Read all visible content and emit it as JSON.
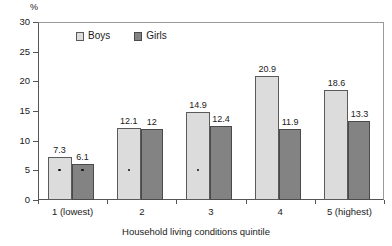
{
  "chart_data": {
    "type": "bar",
    "title": "",
    "xlabel": "Household living conditions quintile",
    "ylabel": "%",
    "ylim": [
      0,
      30
    ],
    "yticks": [
      0,
      5,
      10,
      15,
      20,
      25,
      30
    ],
    "grid": false,
    "legend_position": "top-center",
    "categories": [
      "1 (lowest)",
      "2",
      "3",
      "4",
      "5 (highest)"
    ],
    "series": [
      {
        "name": "Boys",
        "values": [
          7.3,
          12.1,
          14.9,
          20.9,
          18.6
        ],
        "labels": [
          "7.3",
          "12.1",
          "14.9",
          "20.9",
          "18.6"
        ],
        "color": "#dcdcdc"
      },
      {
        "name": "Girls",
        "values": [
          6.1,
          12.0,
          12.4,
          11.9,
          13.3
        ],
        "labels": [
          "6.1",
          "12",
          "12.4",
          "11.9",
          "13.3"
        ],
        "color": "#838383"
      }
    ]
  },
  "axis": {
    "y_unit": "%",
    "y_tick_labels": [
      "30",
      "25",
      "20",
      "15",
      "10",
      "5",
      "0"
    ],
    "x_tick_labels": [
      "1 (lowest)",
      "2",
      "3",
      "4",
      "5 (highest)"
    ],
    "x_title": "Household living conditions quintile"
  },
  "legend": {
    "items": [
      {
        "label": "Boys",
        "swatch": "boys-swatch"
      },
      {
        "label": "Girls",
        "swatch": "girls-swatch"
      }
    ]
  }
}
